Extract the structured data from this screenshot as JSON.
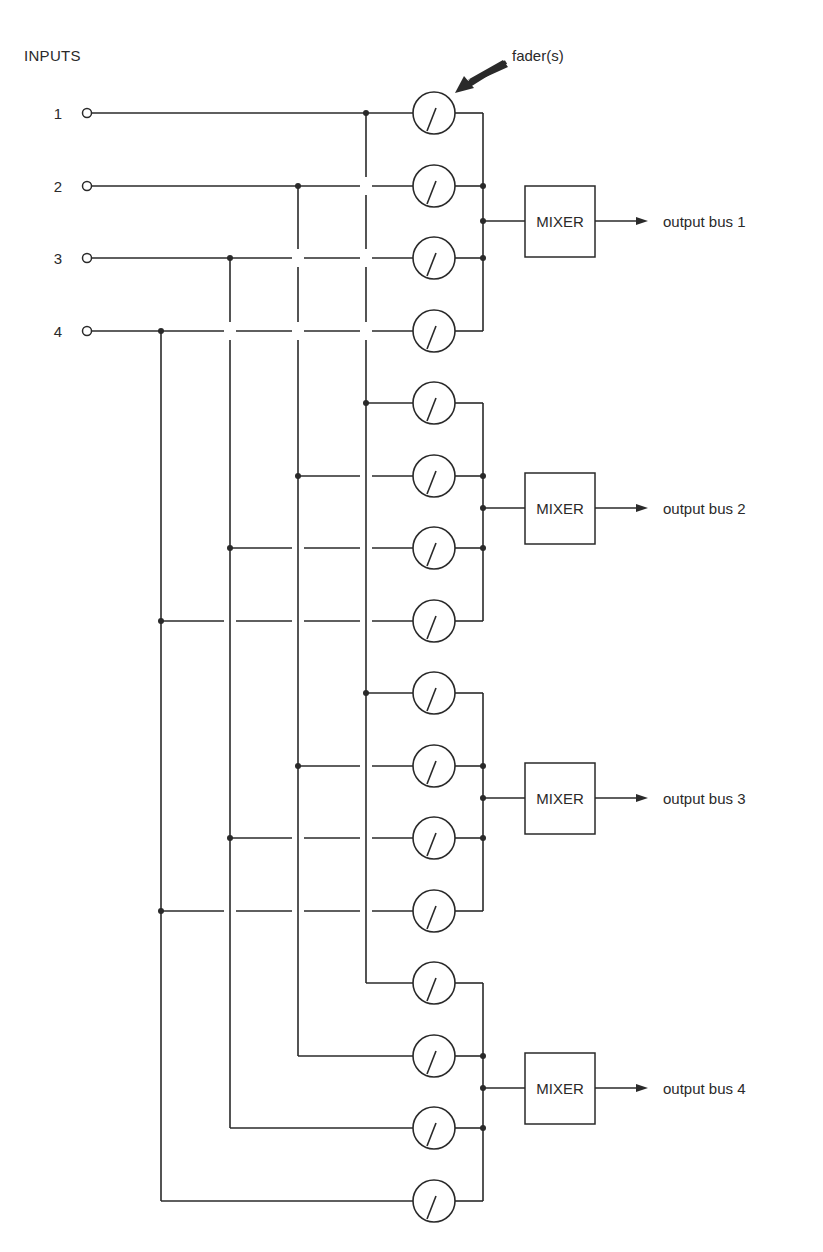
{
  "title": "INPUTS",
  "fader_label": "fader(s)",
  "inputs": [
    {
      "label": "1",
      "y": 113,
      "bus_x": 366
    },
    {
      "label": "2",
      "y": 186,
      "bus_x": 298
    },
    {
      "label": "3",
      "y": 258,
      "bus_x": 230
    },
    {
      "label": "4",
      "y": 331,
      "bus_x": 161
    }
  ],
  "groups": [
    {
      "mixer_label": "MIXER",
      "output_label": "output bus 1",
      "rows": [
        113,
        186,
        258,
        331
      ],
      "mixer_y": 221
    },
    {
      "mixer_label": "MIXER",
      "output_label": "output bus 2",
      "rows": [
        403,
        476,
        548,
        621
      ],
      "mixer_y": 508
    },
    {
      "mixer_label": "MIXER",
      "output_label": "output bus 3",
      "rows": [
        693,
        766,
        838,
        911
      ],
      "mixer_y": 798
    },
    {
      "mixer_label": "MIXER",
      "output_label": "output bus 4",
      "rows": [
        983,
        1056,
        1128,
        1201
      ],
      "mixer_y": 1088
    }
  ],
  "colors": {
    "ink": "#2a2a2a",
    "background": "#ffffff"
  }
}
